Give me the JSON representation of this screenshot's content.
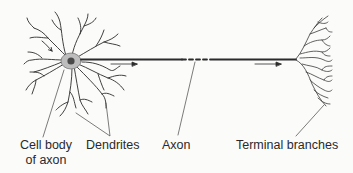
{
  "diagram": {
    "labels": {
      "cell_body_line1": "Cell body",
      "cell_body_line2": "of axon",
      "dendrites": "Dendrites",
      "axon": "Axon",
      "terminal_branches": "Terminal branches"
    },
    "colors": {
      "line": "#2b2b2b",
      "cell_body_fill": "#bdbdbd",
      "nucleus": "#4a4a4a",
      "background": "#fbfbfa"
    },
    "arrows": [
      {
        "name": "signal-arrow-dendrite",
        "direction": "inward"
      },
      {
        "name": "signal-arrow-axon-start",
        "direction": "right"
      },
      {
        "name": "signal-arrow-axon-end",
        "direction": "right"
      }
    ]
  }
}
